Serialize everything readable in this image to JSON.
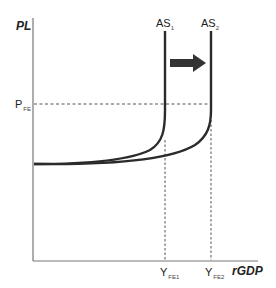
{
  "diagram": {
    "y_axis_label": "PL",
    "x_axis_label": "rGDP",
    "price_level_label": {
      "main": "P",
      "sub": "FE"
    },
    "curves": [
      {
        "name": "AS",
        "sub": "1",
        "color": "#2b2b2b"
      },
      {
        "name": "AS",
        "sub": "2",
        "color": "#2b2b2b"
      }
    ],
    "x_ticks": [
      {
        "main": "Y",
        "sub": "FE1"
      },
      {
        "main": "Y",
        "sub": "FE2"
      }
    ],
    "shift_arrow": {
      "direction": "right",
      "color": "#333333"
    },
    "colors": {
      "axis": "#777777",
      "curve": "#2b2b2b",
      "dashed": "#555555"
    }
  }
}
